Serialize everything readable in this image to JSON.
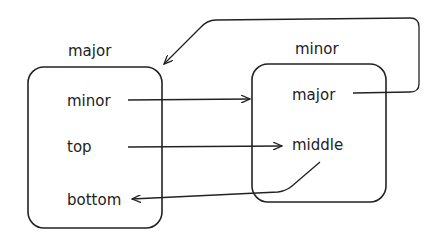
{
  "diagram": {
    "left_box": {
      "title": "major",
      "items": [
        "minor",
        "top",
        "bottom"
      ]
    },
    "right_box": {
      "title": "minor",
      "items": [
        "major",
        "middle"
      ]
    },
    "edges": [
      {
        "from": "major.minor",
        "to": "minor (box)"
      },
      {
        "from": "major.top",
        "to": "minor.middle"
      },
      {
        "from": "minor.middle",
        "to": "major.bottom"
      },
      {
        "from": "minor.major",
        "to": "major (box)"
      }
    ],
    "colors": {
      "stroke": "#222222",
      "background": "#ffffff"
    }
  }
}
